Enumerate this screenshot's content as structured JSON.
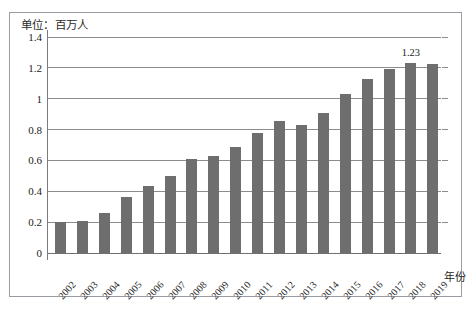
{
  "figure": {
    "unit_label": "单位：百万人",
    "x_axis_title": "年份",
    "value_label": "1.23"
  },
  "chart_data": {
    "type": "bar",
    "title": "",
    "subtitle": "",
    "unit_note": "单位：百万人",
    "xlabel": "年份",
    "ylabel": "",
    "categories": [
      "2002",
      "2003",
      "2004",
      "2005",
      "2006",
      "2007",
      "2008",
      "2009",
      "2010",
      "2011",
      "2012",
      "2013",
      "2014",
      "2015",
      "2016",
      "2017",
      "2018",
      "2019"
    ],
    "values": [
      0.2,
      0.205,
      0.26,
      0.365,
      0.435,
      0.5,
      0.61,
      0.63,
      0.685,
      0.775,
      0.855,
      0.83,
      0.905,
      1.03,
      1.125,
      1.19,
      1.23,
      1.225
    ],
    "series": [
      {
        "name": "人数",
        "values": [
          0.2,
          0.205,
          0.26,
          0.365,
          0.435,
          0.5,
          0.61,
          0.63,
          0.685,
          0.775,
          0.855,
          0.83,
          0.905,
          1.03,
          1.125,
          1.19,
          1.23,
          1.225
        ]
      }
    ],
    "ylim": [
      0,
      1.4
    ],
    "yticks": [
      0,
      0.2,
      0.4,
      0.6,
      0.8,
      1,
      1.2,
      1.4
    ],
    "ytick_labels": [
      "0",
      "0.2",
      "0.4",
      "0.6",
      "0.8",
      "1",
      "1.2",
      "1.4"
    ],
    "grid": true,
    "grid_axis": "y",
    "legend": false,
    "legend_position": "none",
    "bar_color": "#6e6e6e",
    "annotations": [
      {
        "category": "2018",
        "value": 1.23,
        "text": "1.23"
      }
    ]
  }
}
